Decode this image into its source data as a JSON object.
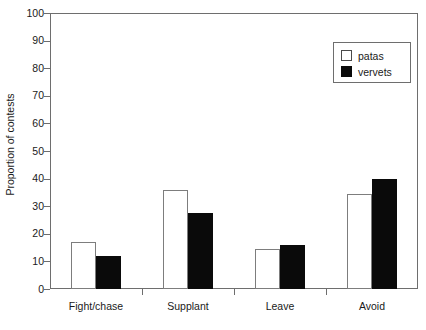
{
  "chart_data": {
    "type": "bar",
    "title": "",
    "subtitle": "",
    "xlabel": "",
    "ylabel": "Proportion of contests",
    "categories": [
      "Fight/chase",
      "Supplant",
      "Leave",
      "Avoid"
    ],
    "series": [
      {
        "name": "patas",
        "color": "#ffffff",
        "edge_color": "#7d7d7d",
        "values": [
          17,
          36,
          14.5,
          34.5
        ]
      },
      {
        "name": "vervets",
        "color": "#0a0a0a",
        "edge_color": "#0a0a0a",
        "values": [
          12,
          27.5,
          16,
          40
        ]
      }
    ],
    "ylim": [
      0,
      100
    ],
    "ytick_step": 10,
    "yticks": [
      0,
      10,
      20,
      30,
      40,
      50,
      60,
      70,
      80,
      90,
      100
    ],
    "ytick_labels": [
      "0",
      "10",
      "20",
      "30",
      "40",
      "50",
      "60",
      "70",
      "80",
      "90",
      "100"
    ],
    "grid": false,
    "legend_position": "top-right",
    "legend_entries": [
      "patas",
      "vervets"
    ],
    "axis_style": "box",
    "annotations": []
  }
}
